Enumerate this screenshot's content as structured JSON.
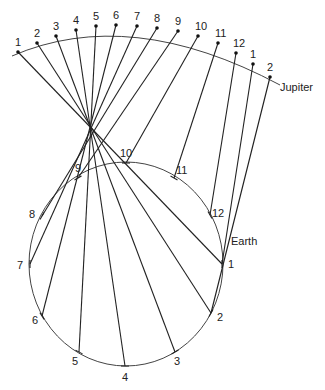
{
  "labels": {
    "jupiter": "Jupiter",
    "earth": "Earth"
  },
  "convergence": [
    91,
    127
  ],
  "jupiter_orbit_path": "M 12 56 Q 130 5 280 85",
  "jupiter_points": [
    {
      "label": "1",
      "x": 18,
      "y": 52
    },
    {
      "label": "2",
      "x": 37,
      "y": 43
    },
    {
      "label": "3",
      "x": 56,
      "y": 36
    },
    {
      "label": "4",
      "x": 76,
      "y": 30
    },
    {
      "label": "5",
      "x": 96,
      "y": 26
    },
    {
      "label": "6",
      "x": 116,
      "y": 25
    },
    {
      "label": "7",
      "x": 137,
      "y": 26
    },
    {
      "label": "8",
      "x": 157,
      "y": 28
    },
    {
      "label": "9",
      "x": 178,
      "y": 31
    },
    {
      "label": "10",
      "x": 198,
      "y": 36
    },
    {
      "label": "11",
      "x": 218,
      "y": 43
    },
    {
      "label": "12",
      "x": 236,
      "y": 53
    },
    {
      "label": "1",
      "x": 253,
      "y": 64
    },
    {
      "label": "2",
      "x": 270,
      "y": 77
    }
  ],
  "earth_orbit": {
    "cx": 126,
    "cy": 264,
    "rx": 97,
    "ry": 102
  },
  "earth_points": [
    {
      "label": "1",
      "x": 222,
      "y": 264
    },
    {
      "label": "2",
      "x": 211,
      "y": 313
    },
    {
      "label": "3",
      "x": 175,
      "y": 352
    },
    {
      "label": "4",
      "x": 125,
      "y": 366
    },
    {
      "label": "5",
      "x": 79,
      "y": 352
    },
    {
      "label": "6",
      "x": 42,
      "y": 316
    },
    {
      "label": "7",
      "x": 30,
      "y": 264
    },
    {
      "label": "8",
      "x": 42,
      "y": 216
    },
    {
      "label": "9",
      "x": 78,
      "y": 178
    },
    {
      "label": "10",
      "x": 126,
      "y": 163
    },
    {
      "label": "11",
      "x": 174,
      "y": 178
    },
    {
      "label": "12",
      "x": 210,
      "y": 215
    }
  ]
}
